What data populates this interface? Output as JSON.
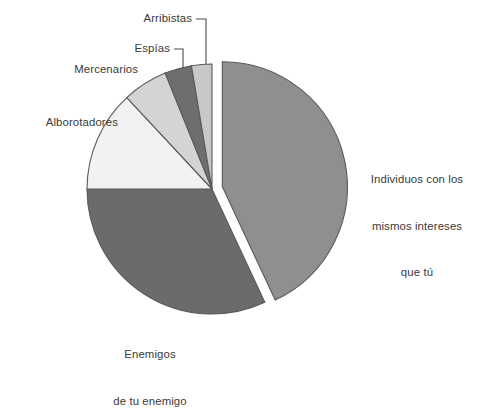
{
  "chart_data": {
    "type": "pie",
    "title": "",
    "subtitle": "",
    "xlabel": "",
    "ylabel": "",
    "legend_position": "none",
    "grid": false,
    "explode_slice": "Individuos con los mismos intereses que tú",
    "start_angle_deg": 0,
    "direction": "clockwise",
    "categories": [
      "Individuos con los mismos intereses que tú",
      "Enemigos de tu enemigo",
      "Alborotadores",
      "Mercenarios",
      "Espías",
      "Arribistas"
    ],
    "values": [
      43,
      32,
      13,
      6,
      3.5,
      2.5
    ],
    "colors": [
      "#8f8f8f",
      "#6b6b6b",
      "#f2f2f2",
      "#d4d4d4",
      "#6e6e6e",
      "#c8c8c8"
    ],
    "slices": [
      {
        "label": "Individuos con los mismos intereses que tú",
        "value": 43,
        "start_deg": 0,
        "end_deg": 155,
        "color": "#8f8f8f",
        "exploded": true
      },
      {
        "label": "Enemigos de tu enemigo",
        "value": 32,
        "start_deg": 155,
        "end_deg": 270,
        "color": "#6b6b6b",
        "exploded": false
      },
      {
        "label": "Alborotadores",
        "value": 13,
        "start_deg": 270,
        "end_deg": 317,
        "color": "#f2f2f2",
        "exploded": false
      },
      {
        "label": "Mercenarios",
        "value": 6,
        "start_deg": 317,
        "end_deg": 338,
        "color": "#d4d4d4",
        "exploded": false
      },
      {
        "label": "Espías",
        "value": 3.5,
        "start_deg": 338,
        "end_deg": 350.5,
        "color": "#6e6e6e",
        "exploded": false
      },
      {
        "label": "Arribistas",
        "value": 2.5,
        "start_deg": 350.5,
        "end_deg": 360,
        "color": "#c8c8c8",
        "exploded": false
      }
    ]
  },
  "labels": {
    "arribistas": "Arribistas",
    "espias": "Espías",
    "mercenarios": "Mercenarios",
    "alborotadores": "Alborotadores",
    "individuos_line1": "Individuos con los",
    "individuos_line2": "mismos intereses",
    "individuos_line3": "que tú",
    "enemigos_line1": "Enemigos",
    "enemigos_line2": "de tu enemigo"
  }
}
